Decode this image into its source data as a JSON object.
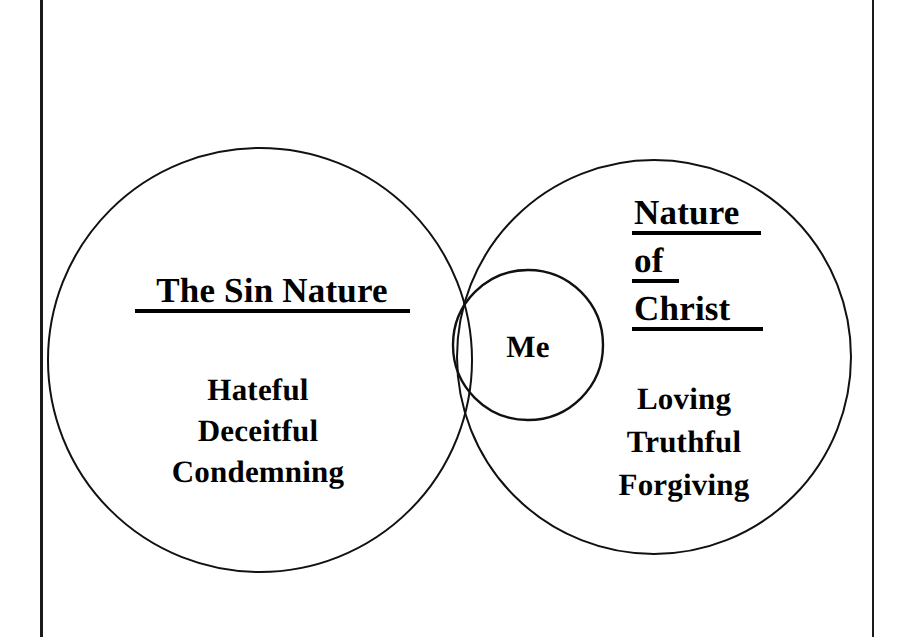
{
  "page": {
    "background_color": "#ffffff",
    "ink_color": "#000000",
    "width": 918,
    "height": 637
  },
  "frame": {
    "left_rule_label": "left-page-rule",
    "right_rule_label": "right-page-rule"
  },
  "diagram": {
    "type": "venn-two-circles-with-overlap-node",
    "left_circle": {
      "name": "sin-nature-circle",
      "heading": "The Sin Nature",
      "heading_underlined": true,
      "traits": [
        "Hateful",
        "Deceitful",
        "Condemning"
      ],
      "cx": 260,
      "cy": 360,
      "r": 212
    },
    "right_circle": {
      "name": "nature-of-christ-circle",
      "heading_lines": [
        "Nature",
        "of",
        "Christ"
      ],
      "heading_underlined": true,
      "traits": [
        "Loving",
        "Truthful",
        "Forgiving"
      ],
      "cx": 654,
      "cy": 357,
      "r": 197
    },
    "center_circle": {
      "name": "me-circle",
      "label": "Me",
      "cx": 528,
      "cy": 345,
      "r": 75
    }
  }
}
